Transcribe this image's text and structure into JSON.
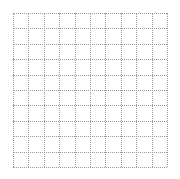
{
  "grid": {
    "rows": 10,
    "columns": 10,
    "cell_size_px": 15.4,
    "line_style": "dotted",
    "line_color": "#9a9a9a",
    "background_color": "#ffffff"
  }
}
